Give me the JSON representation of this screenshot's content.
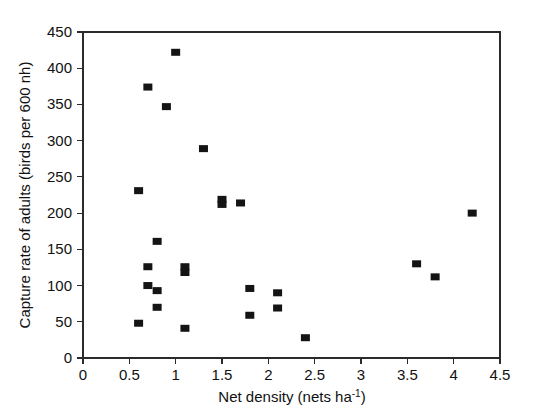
{
  "figure": {
    "background_color": "#ffffff",
    "marker_color": "#141414",
    "axis_color": "#2b2b2b"
  },
  "chart_data": {
    "type": "scatter",
    "title": "",
    "xlabel": "Net density (nets ha",
    "xlabel_superscript": "-1",
    "xlabel_suffix": ")",
    "xlabel_full": "Net density (nets ha⁻¹)",
    "ylabel": "Capture rate of adults (birds per 600 nh)",
    "xlim": [
      0,
      4.5
    ],
    "ylim": [
      0,
      450
    ],
    "xticks": [
      0,
      0.5,
      1,
      1.5,
      2,
      2.5,
      3,
      3.5,
      4,
      4.5
    ],
    "xticklabels": [
      "0",
      "0.5",
      "1",
      "1.5",
      "2",
      "2.5",
      "3",
      "3.5",
      "4",
      "4.5"
    ],
    "yticks": [
      0,
      50,
      100,
      150,
      200,
      250,
      300,
      350,
      400,
      450
    ],
    "yticklabels": [
      "0",
      "50",
      "100",
      "150",
      "200",
      "250",
      "300",
      "350",
      "400",
      "450"
    ],
    "grid": false,
    "legend": null,
    "marker_shape": "square",
    "series": [
      {
        "name": "Capture rate vs net density",
        "points": [
          {
            "x": 0.6,
            "y": 231
          },
          {
            "x": 0.6,
            "y": 48
          },
          {
            "x": 0.7,
            "y": 374
          },
          {
            "x": 0.7,
            "y": 126
          },
          {
            "x": 0.7,
            "y": 100
          },
          {
            "x": 0.8,
            "y": 161
          },
          {
            "x": 0.8,
            "y": 93
          },
          {
            "x": 0.8,
            "y": 70
          },
          {
            "x": 0.9,
            "y": 347
          },
          {
            "x": 1.0,
            "y": 422
          },
          {
            "x": 1.1,
            "y": 126
          },
          {
            "x": 1.1,
            "y": 118
          },
          {
            "x": 1.1,
            "y": 41
          },
          {
            "x": 1.3,
            "y": 289
          },
          {
            "x": 1.5,
            "y": 219
          },
          {
            "x": 1.5,
            "y": 212
          },
          {
            "x": 1.7,
            "y": 214
          },
          {
            "x": 1.8,
            "y": 96
          },
          {
            "x": 1.8,
            "y": 59
          },
          {
            "x": 2.1,
            "y": 90
          },
          {
            "x": 2.1,
            "y": 69
          },
          {
            "x": 2.4,
            "y": 28
          },
          {
            "x": 3.6,
            "y": 130
          },
          {
            "x": 3.8,
            "y": 112
          },
          {
            "x": 4.2,
            "y": 200
          }
        ]
      }
    ]
  }
}
